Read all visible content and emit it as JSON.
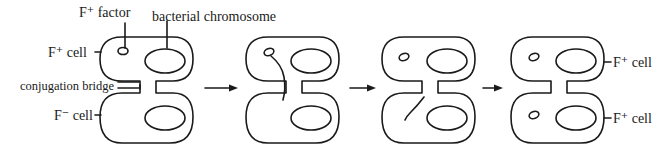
{
  "diagram": {
    "title": "",
    "type": "bacterial-conjugation",
    "labels": {
      "f_plus_factor": "F⁺ factor",
      "bacterial_chromosome": "bacterial chromosome",
      "f_plus_cell_left": "F⁺ cell",
      "conjugation_bridge": "conjugation bridge",
      "f_minus_cell": "F⁻ cell",
      "f_plus_cell_right_top": "F⁺ cell",
      "f_plus_cell_right_bottom": "F⁺ cell"
    },
    "stages": [
      {
        "id": 1,
        "description": "F+ cell with F factor joined to F- cell by conjugation bridge"
      },
      {
        "id": 2,
        "description": "F factor strand passes through bridge"
      },
      {
        "id": 3,
        "description": "Strand transferred into recipient cell"
      },
      {
        "id": 4,
        "description": "Both cells now contain F factor"
      }
    ],
    "arrows": 3,
    "colors": {
      "line": "#1a1a1a",
      "background": "#ffffff"
    }
  }
}
